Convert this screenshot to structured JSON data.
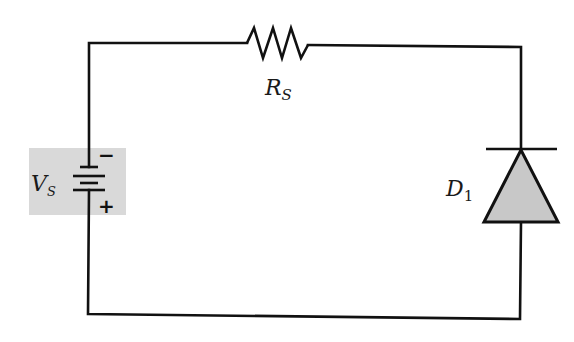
{
  "diagram": {
    "type": "circuit",
    "components": {
      "source": {
        "symbol": "V",
        "subscript": "S",
        "minus": "−",
        "plus": "+",
        "highlight_color": "#d9d9d9"
      },
      "resistor": {
        "symbol": "R",
        "subscript": "S"
      },
      "diode": {
        "symbol": "D",
        "subscript": "1",
        "fill_color": "#c8c8c8"
      }
    },
    "wire_color": "#111111"
  }
}
